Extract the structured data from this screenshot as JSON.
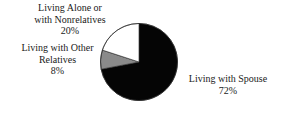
{
  "figure": {
    "background_color": "#ffffff",
    "text_color": "#1a1a1a"
  },
  "chart_data": {
    "type": "pie",
    "title": "",
    "subtitle": "",
    "xlabel": "",
    "ylabel": "",
    "legend_position": "callout-labels",
    "grid": false,
    "start_angle_deg": 0,
    "direction": "clockwise",
    "total": 100,
    "units": "%",
    "categories": [
      "Living with Spouse",
      "Living Alone or with Nonrelatives",
      "Living with Other Relatives"
    ],
    "values": [
      72,
      20,
      8
    ],
    "slices": [
      {
        "name": "Living with Spouse",
        "value": 72,
        "value_label": "72%",
        "color": "#050505",
        "label_lines": [
          "Living with Spouse",
          "72%"
        ],
        "start_deg": 0,
        "end_deg": 259.2
      },
      {
        "name": "Living with Other Relatives",
        "value": 8,
        "value_label": "8%",
        "color": "#8a8a8a",
        "label_lines": [
          "Living with Other",
          "Relatives",
          "8%"
        ],
        "start_deg": 259.2,
        "end_deg": 288.0
      },
      {
        "name": "Living Alone or with Nonrelatives",
        "value": 20,
        "value_label": "20%",
        "color": "#ffffff",
        "label_lines": [
          "Living Alone or",
          "with Nonrelatives",
          "20%"
        ],
        "start_deg": 288.0,
        "end_deg": 360.0
      }
    ]
  },
  "labels": {
    "alone": {
      "line1": "Living Alone or",
      "line2": "with Nonrelatives",
      "line3": "20%"
    },
    "other_relatives": {
      "line1": "Living with Other",
      "line2": "Relatives",
      "line3": "8%"
    },
    "spouse": {
      "line1": "Living with Spouse",
      "line2": "72%"
    }
  }
}
